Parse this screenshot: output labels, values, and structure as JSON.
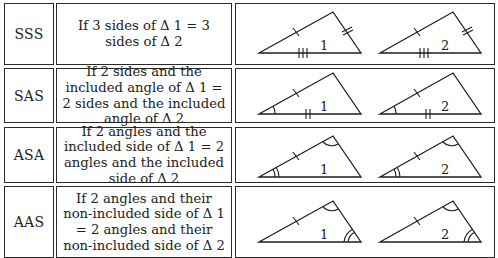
{
  "table": {
    "rows": [
      {
        "abbr": "SSS",
        "description": "If 3 sides of Δ 1 = 3 sides of Δ 2",
        "triangle_labels": [
          "1",
          "2"
        ],
        "markings": [
          "single tick on left side",
          "double tick on right side",
          "triple tick on base"
        ]
      },
      {
        "abbr": "SAS",
        "description": "If 2 sides and the included angle of Δ 1 = 2 sides and the included angle of Δ 2",
        "triangle_labels": [
          "1",
          "2"
        ],
        "markings": [
          "single tick on left side",
          "double tick on base",
          "single arc at left vertex"
        ]
      },
      {
        "abbr": "ASA",
        "description": "If 2 angles and the included side of Δ 1 = 2 angles and the included side of Δ 2",
        "triangle_labels": [
          "1",
          "2"
        ],
        "markings": [
          "single tick on left side",
          "double arc at left vertex",
          "single arc at top vertex"
        ]
      },
      {
        "abbr": "AAS",
        "description": "If 2 angles and their non-included side of Δ 1 = 2 angles and their non-included side of Δ 2",
        "triangle_labels": [
          "1",
          "2"
        ],
        "markings": [
          "single tick on left side",
          "single arc at top vertex",
          "double arc at right vertex"
        ]
      }
    ]
  }
}
